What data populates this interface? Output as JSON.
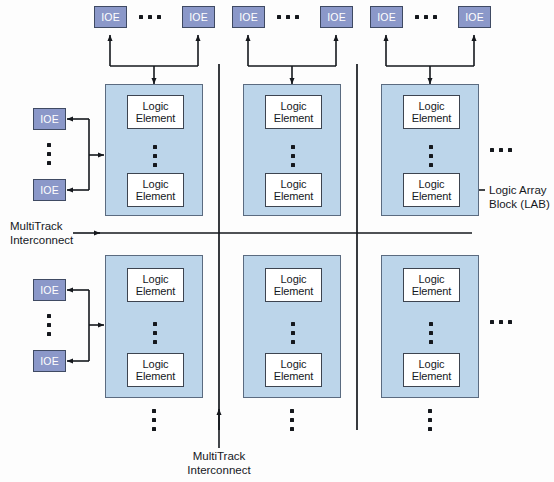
{
  "diagram": {
    "colors": {
      "lab_fill": "#bcd5ea",
      "lab_border": "#5b6b80",
      "ioe_fill": "#8b98c9",
      "ioe_border": "#3f4a63",
      "le_fill": "#ffffff",
      "le_border": "#3d4450",
      "line": "#15181d",
      "background": "#fdfdfd"
    },
    "labels": {
      "ioe": "IOE",
      "logic_element_line1": "Logic",
      "logic_element_line2": "Element",
      "multitrack_line1": "MultiTrack",
      "multitrack_line2": "Interconnect",
      "lab_callout_line1": "Logic Array",
      "lab_callout_line2": "Block (LAB)"
    },
    "top_ioe_groups": [
      {
        "left_label": "IOE",
        "right_label": "IOE",
        "ellipsis": "..."
      },
      {
        "left_label": "IOE",
        "right_label": "IOE",
        "ellipsis": "..."
      },
      {
        "left_label": "IOE",
        "right_label": "IOE",
        "ellipsis": "..."
      }
    ],
    "left_ioe_groups": [
      {
        "top_label": "IOE",
        "bottom_label": "IOE",
        "ellipsis_vertical": true
      },
      {
        "top_label": "IOE",
        "bottom_label": "IOE",
        "ellipsis_vertical": true
      }
    ],
    "lab_grid": {
      "rows": 2,
      "columns": 3,
      "cell": {
        "logic_elements": [
          {
            "line1": "Logic",
            "line2": "Element"
          },
          {
            "line1": "Logic",
            "line2": "Element"
          }
        ],
        "vertical_ellipsis": true
      }
    },
    "callouts": [
      {
        "name": "multitrack-interconnect-horizontal",
        "line1": "MultiTrack",
        "line2": "Interconnect",
        "arrow_direction": "right"
      },
      {
        "name": "multitrack-interconnect-vertical",
        "line1": "MultiTrack",
        "line2": "Interconnect",
        "arrow_direction": "up"
      },
      {
        "name": "logic-array-block",
        "line1": "Logic Array",
        "line2": "Block (LAB)",
        "arrow_direction": "left"
      }
    ],
    "continuation_ellipses": {
      "right_row1": "...",
      "right_row2": "...",
      "bottom_column1": "vertical",
      "bottom_column2": "vertical",
      "bottom_column3": "vertical"
    }
  }
}
